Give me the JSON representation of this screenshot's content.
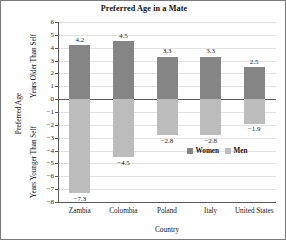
{
  "chart_data": {
    "type": "bar",
    "title": "Preferred Age in a Mate",
    "xlabel": "Country",
    "ylabel": "Preferred Age",
    "ylabel_upper": "Years Older Than Self",
    "ylabel_lower": "Years Younger Than Self",
    "categories": [
      "Zambia",
      "Colombia",
      "Poland",
      "Italy",
      "United States"
    ],
    "series": [
      {
        "name": "Women",
        "color": "#858585",
        "values": [
          4.2,
          4.5,
          3.3,
          3.3,
          2.5
        ]
      },
      {
        "name": "Men",
        "color": "#bcbcbc",
        "values": [
          -7.3,
          -4.5,
          -2.8,
          -2.8,
          -1.9
        ]
      }
    ],
    "value_labels": {
      "women": [
        "4.2",
        "4.5",
        "3.3",
        "3.3",
        "2.5"
      ],
      "men": [
        "−7.3",
        "−4.5",
        "−2.8",
        "−2.8",
        "−1.9"
      ]
    },
    "ylim": [
      -8,
      6
    ],
    "ytick_step": 1,
    "ytick_labels": [
      "6",
      "5",
      "4",
      "3",
      "2",
      "1",
      "0",
      "−1",
      "−2",
      "−3",
      "−4",
      "−5",
      "−6",
      "−7",
      "−8"
    ],
    "ytick_values": [
      6,
      5,
      4,
      3,
      2,
      1,
      0,
      -1,
      -2,
      -3,
      -4,
      -5,
      -6,
      -7,
      -8
    ],
    "grid": true,
    "legend_position": "inside-lower-right",
    "legend_entries": [
      "Women",
      "Men"
    ]
  }
}
